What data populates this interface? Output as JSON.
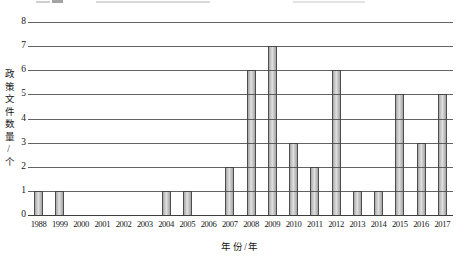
{
  "chart_data": {
    "type": "bar",
    "title": "",
    "categories": [
      "1988",
      "1999",
      "2000",
      "2001",
      "2002",
      "2003",
      "2004",
      "2005",
      "2006",
      "2007",
      "2008",
      "2009",
      "2010",
      "2011",
      "2012",
      "2013",
      "2014",
      "2015",
      "2016",
      "2017"
    ],
    "values": [
      1,
      1,
      0,
      0,
      0,
      0,
      1,
      1,
      0,
      2,
      6,
      7,
      3,
      2,
      6,
      1,
      1,
      5,
      3,
      5
    ],
    "xlabel": "年份/年",
    "ylabel": "政策文件数量/个",
    "ylim": [
      0,
      8
    ],
    "yticks": [
      0,
      1,
      2,
      3,
      4,
      5,
      6,
      7,
      8
    ],
    "grid": "horizontal",
    "legend": "none",
    "bar_fill": "#c6c6c6",
    "bar_fill_highlight": "#e0e0e0",
    "bar_fill_shadow": "#a4a4a4",
    "bar_border": "#4d4d4d",
    "gridline_color": "#464646",
    "axis_color": "#3d3d3d",
    "text_color": "#151515",
    "background": "#ffffff"
  }
}
